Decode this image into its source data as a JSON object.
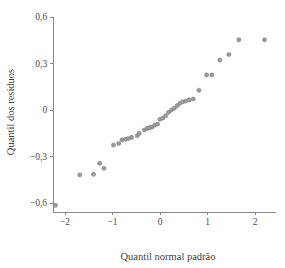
{
  "chart_data": {
    "type": "scatter",
    "title": "",
    "xlabel": "Quantil normal padrão",
    "ylabel": "Quantil dos resíduos",
    "xlim": [
      -2.25,
      2.45
    ],
    "ylim": [
      -0.66,
      0.6
    ],
    "grid": false,
    "legend": null,
    "xticks": [
      -2,
      -1,
      0,
      1,
      2
    ],
    "xtick_labels": [
      "−2",
      "−1",
      "0",
      "1",
      "2"
    ],
    "yticks": [
      -0.6,
      -0.3,
      0,
      0.3,
      0.6
    ],
    "ytick_labels": [
      "−0,6",
      "−0,3",
      "0",
      "0,3",
      "0,6"
    ],
    "marker": "circle",
    "marker_color": "#9a9a9a",
    "points": [
      {
        "x": -2.2,
        "y": -0.615
      },
      {
        "x": -1.69,
        "y": -0.419
      },
      {
        "x": -1.4,
        "y": -0.415
      },
      {
        "x": -1.18,
        "y": -0.376
      },
      {
        "x": -1.27,
        "y": -0.344
      },
      {
        "x": -0.98,
        "y": -0.226
      },
      {
        "x": -0.87,
        "y": -0.216
      },
      {
        "x": -0.8,
        "y": -0.193
      },
      {
        "x": -0.73,
        "y": -0.189
      },
      {
        "x": -0.67,
        "y": -0.184
      },
      {
        "x": -0.6,
        "y": -0.177
      },
      {
        "x": -0.48,
        "y": -0.166
      },
      {
        "x": -0.44,
        "y": -0.151
      },
      {
        "x": -0.33,
        "y": -0.129
      },
      {
        "x": -0.27,
        "y": -0.119
      },
      {
        "x": -0.22,
        "y": -0.114
      },
      {
        "x": -0.17,
        "y": -0.111
      },
      {
        "x": -0.11,
        "y": -0.097
      },
      {
        "x": -0.05,
        "y": -0.091
      },
      {
        "x": 0.0,
        "y": -0.06
      },
      {
        "x": 0.06,
        "y": -0.052
      },
      {
        "x": 0.12,
        "y": -0.037
      },
      {
        "x": 0.18,
        "y": -0.015
      },
      {
        "x": 0.24,
        "y": 0.0
      },
      {
        "x": 0.3,
        "y": 0.011
      },
      {
        "x": 0.36,
        "y": 0.028
      },
      {
        "x": 0.42,
        "y": 0.043
      },
      {
        "x": 0.48,
        "y": 0.053
      },
      {
        "x": 0.54,
        "y": 0.058
      },
      {
        "x": 0.61,
        "y": 0.065
      },
      {
        "x": 0.7,
        "y": 0.071
      },
      {
        "x": 0.82,
        "y": 0.127
      },
      {
        "x": 0.98,
        "y": 0.226
      },
      {
        "x": 1.09,
        "y": 0.226
      },
      {
        "x": 1.26,
        "y": 0.322
      },
      {
        "x": 1.45,
        "y": 0.358
      },
      {
        "x": 1.66,
        "y": 0.453
      },
      {
        "x": 2.2,
        "y": 0.453
      }
    ]
  },
  "figure": {
    "background_color": "#ffffff",
    "axis_color": "#8a8a8a"
  }
}
